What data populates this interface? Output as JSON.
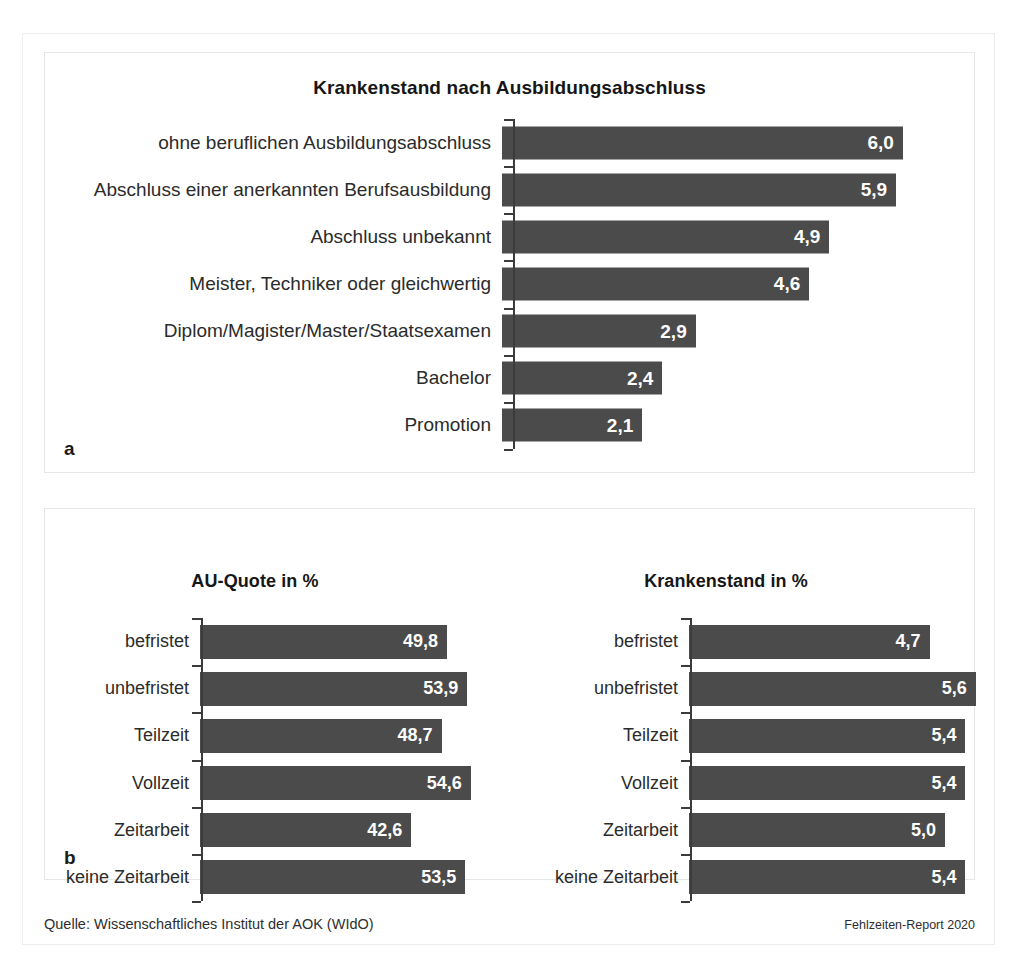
{
  "figure": {
    "panel_a_letter": "a",
    "panel_b_letter": "b"
  },
  "footer": {
    "source": "Quelle: Wissenschaftliches Institut der AOK (WIdO)",
    "report": "Fehlzeiten-Report 2020"
  },
  "colors": {
    "bar": "#4b4b4b",
    "value_text": "#ffffff",
    "axis": "#3b3b3b",
    "panel_border": "#e6e6e6"
  },
  "chart_data": [
    {
      "id": "chart_a",
      "type": "bar",
      "orientation": "horizontal",
      "title": "Krankenstand nach Ausbildungsabschluss",
      "xlabel": "",
      "ylabel": "",
      "xlim": [
        0,
        6.3
      ],
      "grid": false,
      "legend": "none",
      "value_format": "german-decimal-comma",
      "categories": [
        "ohne beruflichen Ausbildungsabschluss",
        "Abschluss einer anerkannten Berufsausbildung",
        "Abschluss unbekannt",
        "Meister, Techniker oder gleichwertig",
        "Diplom/Magister/Master/Staatsexamen",
        "Bachelor",
        "Promotion"
      ],
      "values": [
        6.0,
        5.9,
        4.9,
        4.6,
        2.9,
        2.4,
        2.1
      ],
      "labels": [
        "6,0",
        "5,9",
        "4,9",
        "4,6",
        "2,9",
        "2,4",
        "2,1"
      ]
    },
    {
      "id": "chart_b_left",
      "type": "bar",
      "orientation": "horizontal",
      "title": "AU-Quote in %",
      "xlabel": "",
      "ylabel": "",
      "xlim": [
        0,
        59
      ],
      "grid": false,
      "legend": "none",
      "value_format": "german-decimal-comma",
      "categories": [
        "befristet",
        "unbefristet",
        "Teilzeit",
        "Vollzeit",
        "Zeitarbeit",
        "keine Zeitarbeit"
      ],
      "values": [
        49.8,
        53.9,
        48.7,
        54.6,
        42.6,
        53.5
      ],
      "labels": [
        "49,8",
        "53,9",
        "48,7",
        "54,6",
        "42,6",
        "53,5"
      ]
    },
    {
      "id": "chart_b_right",
      "type": "bar",
      "orientation": "horizontal",
      "title": "Krankenstand  in %",
      "xlabel": "",
      "ylabel": "",
      "xlim": [
        0,
        6.0
      ],
      "grid": false,
      "legend": "none",
      "value_format": "german-decimal-comma",
      "categories": [
        "befristet",
        "unbefristet",
        "Teilzeit",
        "Vollzeit",
        "Zeitarbeit",
        "keine Zeitarbeit"
      ],
      "values": [
        4.7,
        5.6,
        5.4,
        5.4,
        5.0,
        5.4
      ],
      "labels": [
        "4,7",
        "5,6",
        "5,4",
        "5,4",
        "5,0",
        "5,4"
      ]
    }
  ]
}
